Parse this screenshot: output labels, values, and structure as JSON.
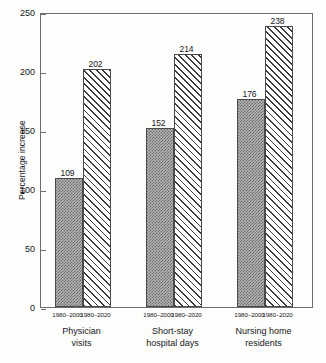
{
  "chart_data": {
    "type": "bar",
    "title": "",
    "xlabel": "",
    "ylabel": "Percentage increase",
    "ylim": [
      0,
      250
    ],
    "yticks": [
      0,
      50,
      100,
      150,
      200,
      250
    ],
    "grid": false,
    "legend_position": "none",
    "categories": [
      "Physician visits",
      "Short-stay hospital days",
      "Nursing home residents"
    ],
    "category_lines": [
      [
        "Physician",
        "visits"
      ],
      [
        "Short-stay",
        "hospital days"
      ],
      [
        "Nursing home",
        "residents"
      ]
    ],
    "group_tick_labels": [
      "1980–2000",
      "1980–2020"
    ],
    "series": [
      {
        "name": "1980–2000",
        "pattern": "checkerboard-grey",
        "values": [
          109,
          152,
          176
        ]
      },
      {
        "name": "1980–2020",
        "pattern": "diagonal-hatch",
        "values": [
          202,
          214,
          238
        ]
      }
    ],
    "value_labels": [
      "109",
      "202",
      "152",
      "214",
      "176",
      "238"
    ],
    "colors": {
      "axis": "#6d6d70",
      "bar_outline": "#4a4a4d",
      "fill_grey": "#b4b4b4",
      "hatch": "#3a3a3d",
      "background": "#fdfdfc",
      "text": "#17171a"
    }
  },
  "axis": {
    "y_tick_labels": [
      "250",
      "200",
      "150",
      "100",
      "50",
      "0"
    ]
  },
  "bars": [
    {
      "value_label": "109",
      "tick_label": "1980–2000"
    },
    {
      "value_label": "202",
      "tick_label": "1980–2020"
    },
    {
      "value_label": "152",
      "tick_label": "1980–2000"
    },
    {
      "value_label": "214",
      "tick_label": "1980–2020"
    },
    {
      "value_label": "176",
      "tick_label": "1980–2000"
    },
    {
      "value_label": "238",
      "tick_label": "1980–2020"
    }
  ],
  "groups": [
    {
      "line1": "Physician",
      "line2": "visits"
    },
    {
      "line1": "Short-stay",
      "line2": "hospital days"
    },
    {
      "line1": "Nursing home",
      "line2": "residents"
    }
  ]
}
